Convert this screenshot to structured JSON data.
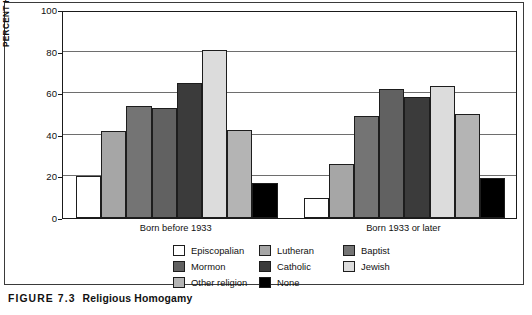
{
  "figure": {
    "label": "FIGURE 7.3",
    "title": "Religious Homogamy"
  },
  "chart_data": {
    "type": "bar",
    "title": "Religious Homogamy",
    "xlabel": "",
    "ylabel": "PERCENT HOMOGAMOUS",
    "ylim": [
      0,
      100
    ],
    "yticks": [
      0,
      20,
      40,
      60,
      80,
      100
    ],
    "grid": true,
    "legend_position": "bottom",
    "categories": [
      "Born before 1933",
      "Born 1933 or later"
    ],
    "series": [
      {
        "name": "Episcopalian",
        "color": "#ffffff",
        "values": [
          20,
          9.5
        ]
      },
      {
        "name": "Lutheran",
        "color": "#a6a6a6",
        "values": [
          42,
          26
        ]
      },
      {
        "name": "Baptist",
        "color": "#747474",
        "values": [
          54,
          49
        ]
      },
      {
        "name": "Mormon",
        "color": "#616161",
        "values": [
          53,
          62
        ]
      },
      {
        "name": "Catholic",
        "color": "#3b3b3b",
        "values": [
          65,
          58
        ]
      },
      {
        "name": "Jewish",
        "color": "#dcdcdc",
        "values": [
          81,
          63.5
        ]
      },
      {
        "name": "Other religion",
        "color": "#b4b4b4",
        "values": [
          42.5,
          50
        ]
      },
      {
        "name": "None",
        "color": "#000000",
        "values": [
          17,
          19
        ]
      }
    ]
  },
  "axis": {
    "y_title": "PERCENT HOMOGAMOUS",
    "ticks": [
      "100",
      "80",
      "60",
      "40",
      "20",
      "0"
    ]
  },
  "legend": {
    "items": [
      {
        "label": "Episcopalian",
        "color": "#ffffff"
      },
      {
        "label": "Lutheran",
        "color": "#a6a6a6"
      },
      {
        "label": "Baptist",
        "color": "#747474"
      },
      {
        "label": "Mormon",
        "color": "#616161"
      },
      {
        "label": "Catholic",
        "color": "#3b3b3b"
      },
      {
        "label": "Jewish",
        "color": "#dcdcdc"
      },
      {
        "label": "Other religion",
        "color": "#b4b4b4"
      },
      {
        "label": "None",
        "color": "#000000"
      }
    ]
  }
}
